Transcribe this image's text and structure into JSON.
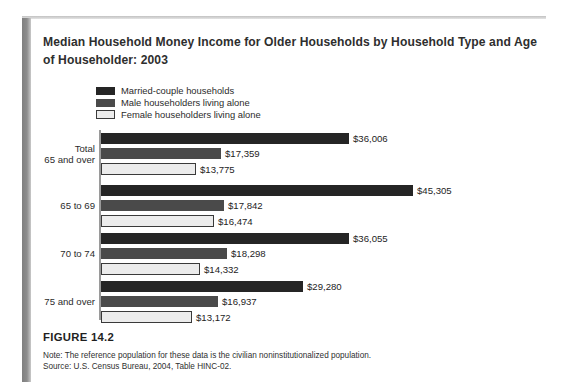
{
  "figure": {
    "title": "Median Household Money Income for Older Households by Household Type and Age of Householder: 2003",
    "number_label": "FIGURE 14.2",
    "note": "Note: The reference population for these data is the civilian noninstitutionalized population.",
    "source": "Source: U.S. Census Bureau, 2004, Table HINC-02."
  },
  "colors": {
    "series_married": "#252525",
    "series_male": "#4a4a4a",
    "series_female": "#ececec",
    "series_female_outline": "#3a3a3a",
    "axis": "#9a9a9a",
    "text": "#2b2b2b",
    "page_background": "#ffffff"
  },
  "chart_data": {
    "type": "bar",
    "orientation": "horizontal",
    "title": "Median Household Money Income for Older Households by Household Type and Age of Householder: 2003",
    "xlabel": "",
    "ylabel": "",
    "grid": false,
    "legend_position": "top-left",
    "xlim": [
      0,
      45305
    ],
    "categories": [
      "Total\n65 and over",
      "65 to 69",
      "70 to 74",
      "75 and over"
    ],
    "series": [
      {
        "name": "Married-couple households",
        "color": "#252525",
        "values": [
          36006,
          45305,
          36055,
          29280
        ],
        "labels": [
          "$36,006",
          "$45,305",
          "$36,055",
          "$29,280"
        ]
      },
      {
        "name": "Male householders living alone",
        "color": "#4a4a4a",
        "values": [
          17359,
          17842,
          18298,
          16937
        ],
        "labels": [
          "$17,359",
          "$17,842",
          "$18,298",
          "$16,937"
        ]
      },
      {
        "name": "Female householders living alone",
        "color": "#ececec",
        "values": [
          13775,
          16474,
          14332,
          13172
        ],
        "labels": [
          "$13,775",
          "$16,474",
          "$14,332",
          "$13,172"
        ]
      }
    ]
  }
}
